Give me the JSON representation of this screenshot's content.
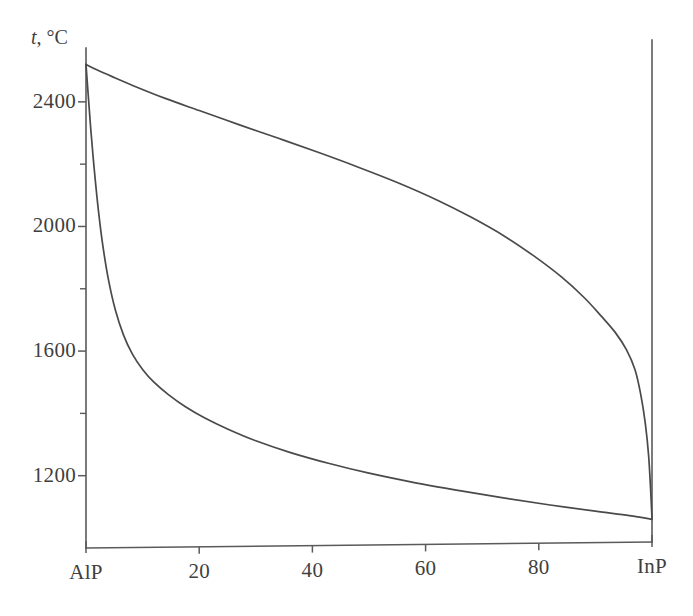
{
  "figure": {
    "background_color": "#ffffff",
    "line_color": "#4a4a4a",
    "axis_color": "#5a5a5a"
  },
  "axes": {
    "y_axis_title": "t, °C",
    "y_title_variable": "t",
    "y_title_unit": ", °C",
    "y_ticks_major": [
      {
        "value": 2400,
        "label": "2400"
      },
      {
        "value": 2000,
        "label": "2000"
      },
      {
        "value": 1600,
        "label": "1600"
      },
      {
        "value": 1200,
        "label": "1200"
      }
    ],
    "y_ticks_minor": [
      2200,
      1800,
      1400
    ],
    "x_ticks": [
      {
        "value": 0,
        "label": "AlP"
      },
      {
        "value": 20,
        "label": "20"
      },
      {
        "value": 40,
        "label": "40"
      },
      {
        "value": 60,
        "label": "60"
      },
      {
        "value": 80,
        "label": "80"
      },
      {
        "value": 100,
        "label": "InP"
      }
    ]
  },
  "chart_data": {
    "type": "line",
    "title": "",
    "subtitle": "",
    "xlabel": "",
    "ylabel": "t, °C",
    "xlim": [
      0,
      100
    ],
    "ylim": [
      1000,
      2560
    ],
    "grid": false,
    "legend_position": "none",
    "x_tick_labels": [
      "AlP",
      "20",
      "40",
      "60",
      "80",
      "InP"
    ],
    "x_tick_values": [
      0,
      20,
      40,
      60,
      80,
      100
    ],
    "y_tick_labels": [
      "2400",
      "2000",
      "1600",
      "1200"
    ],
    "y_tick_values": [
      2400,
      2000,
      1600,
      1200
    ],
    "y_minor_tick_values": [
      2200,
      1800,
      1400
    ],
    "annotations": [],
    "series": [
      {
        "name": "liquidus",
        "x": [
          0,
          2,
          5,
          9,
          14,
          20,
          27,
          34,
          41,
          48,
          55,
          62,
          68,
          74,
          79,
          84,
          88,
          91,
          93.5,
          95.5,
          97,
          98,
          98.8,
          99.4,
          99.8,
          100
        ],
        "values": [
          2520,
          2502,
          2478,
          2447,
          2411,
          2372,
          2327,
          2283,
          2238,
          2191,
          2141,
          2085,
          2030,
          1968,
          1907,
          1838,
          1772,
          1713,
          1660,
          1604,
          1540,
          1462,
          1370,
          1265,
          1140,
          1062
        ]
      },
      {
        "name": "solidus",
        "x": [
          0,
          0.4,
          0.9,
          1.5,
          2.2,
          3.0,
          4.0,
          5.2,
          6.6,
          8.2,
          10,
          12,
          14.5,
          17.5,
          21,
          25,
          30,
          36,
          43,
          50,
          58,
          66,
          74,
          82,
          90,
          96,
          100
        ],
        "values": [
          2520,
          2420,
          2300,
          2175,
          2050,
          1935,
          1826,
          1731,
          1653,
          1590,
          1541,
          1500,
          1461,
          1422,
          1385,
          1350,
          1312,
          1275,
          1239,
          1208,
          1178,
          1152,
          1128,
          1106,
          1086,
          1072,
          1060
        ]
      }
    ]
  }
}
